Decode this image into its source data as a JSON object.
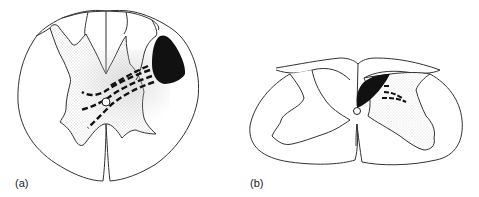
{
  "figure": {
    "panels": [
      {
        "id": "a",
        "label": "(a)",
        "description": "Spinal cord cross-section with dark lesion in dorsolateral white matter and dashed fibers crossing near central canal"
      },
      {
        "id": "b",
        "label": "(b)",
        "description": "Flattened spinal cord cross-section with dark lesion adjacent to posterior median septum and short dashed fibers"
      }
    ],
    "colors": {
      "outline": "#333333",
      "lesion": "#111111",
      "grey_matter_stipple": "#cfcfcf",
      "background": "#ffffff"
    }
  }
}
